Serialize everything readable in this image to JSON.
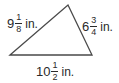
{
  "diagram": {
    "type": "triangle",
    "stroke_color": "#4a4a4a",
    "vertices": {
      "left": [
        10,
        55
      ],
      "top": [
        68,
        5
      ],
      "right": [
        92,
        55
      ]
    },
    "sides": [
      {
        "id": "left",
        "whole": "9",
        "numerator": "1",
        "denominator": "8",
        "unit": "in."
      },
      {
        "id": "right",
        "whole": "6",
        "numerator": "3",
        "denominator": "4",
        "unit": "in."
      },
      {
        "id": "bottom",
        "whole": "10",
        "numerator": "1",
        "denominator": "2",
        "unit": "in."
      }
    ]
  }
}
